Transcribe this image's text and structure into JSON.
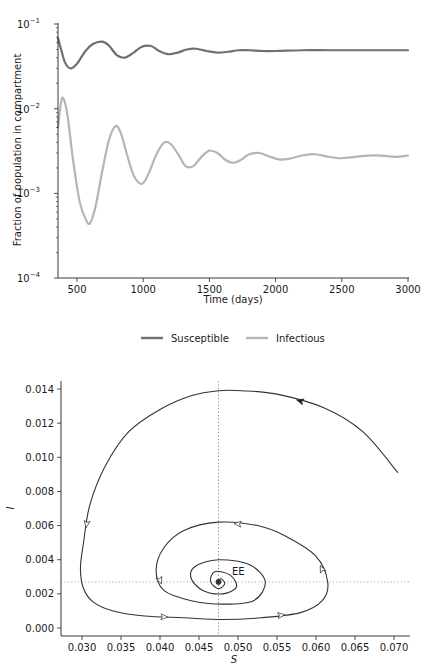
{
  "chart_data": [
    {
      "type": "line",
      "title": "",
      "xlabel": "Time (days)",
      "ylabel": "Fraction of population in compartment",
      "yscale": "log",
      "xlim": [
        357,
        3000
      ],
      "ylim": [
        0.0001,
        0.1
      ],
      "xticks": [
        "500",
        "1000",
        "1500",
        "2000",
        "2500",
        "3000"
      ],
      "yticks": [
        "10^-1",
        "10^-2",
        "10^-3",
        "10^-4"
      ],
      "grid": false,
      "legend_position": "below",
      "series": [
        {
          "name": "Susceptible",
          "color": "#707070",
          "x": [
            357,
            380,
            410,
            450,
            500,
            560,
            620,
            690,
            740,
            800,
            860,
            920,
            990,
            1060,
            1120,
            1190,
            1260,
            1330,
            1400,
            1480,
            1560,
            1640,
            1720,
            1800,
            1900,
            2000,
            2200,
            2400,
            2600,
            2800,
            3000
          ],
          "values": [
            0.068,
            0.05,
            0.035,
            0.03,
            0.034,
            0.047,
            0.058,
            0.062,
            0.056,
            0.043,
            0.04,
            0.045,
            0.054,
            0.055,
            0.048,
            0.044,
            0.046,
            0.05,
            0.051,
            0.048,
            0.046,
            0.047,
            0.049,
            0.049,
            0.048,
            0.048,
            0.049,
            0.049,
            0.049,
            0.049,
            0.049
          ]
        },
        {
          "name": "Infectious",
          "color": "#b5b5b5",
          "x": [
            357,
            380,
            400,
            430,
            470,
            520,
            570,
            600,
            640,
            690,
            740,
            790,
            830,
            880,
            930,
            990,
            1040,
            1100,
            1160,
            1210,
            1270,
            1320,
            1380,
            1440,
            1500,
            1560,
            1620,
            1680,
            1740,
            1800,
            1880,
            1960,
            2040,
            2120,
            2200,
            2300,
            2400,
            2500,
            2600,
            2700,
            2800,
            2900,
            3000
          ],
          "values": [
            0.006,
            0.012,
            0.013,
            0.008,
            0.0025,
            0.0008,
            0.00048,
            0.00045,
            0.0007,
            0.0018,
            0.0042,
            0.0062,
            0.0052,
            0.0028,
            0.0016,
            0.0013,
            0.0017,
            0.0029,
            0.004,
            0.0038,
            0.0028,
            0.0021,
            0.0021,
            0.0027,
            0.0032,
            0.003,
            0.0025,
            0.0023,
            0.0025,
            0.0029,
            0.003,
            0.0027,
            0.0025,
            0.0026,
            0.0028,
            0.0029,
            0.0027,
            0.0026,
            0.0027,
            0.0028,
            0.0028,
            0.0027,
            0.0028
          ]
        }
      ]
    },
    {
      "type": "line",
      "subtype": "phase-portrait",
      "title": "",
      "xlabel": "S",
      "ylabel": "I",
      "xlim": [
        0.0273,
        0.0718
      ],
      "ylim": [
        -0.0004,
        0.0145
      ],
      "xticks": [
        "0.030",
        "0.035",
        "0.040",
        "0.045",
        "0.050",
        "0.055",
        "0.060",
        "0.065",
        "0.070"
      ],
      "yticks": [
        "0.000",
        "0.002",
        "0.004",
        "0.006",
        "0.008",
        "0.010",
        "0.012",
        "0.014"
      ],
      "grid": false,
      "annotations": [
        {
          "text": "EE",
          "S": 0.0488,
          "I": 0.0031
        }
      ],
      "reference_lines": {
        "vertical_S": 0.0475,
        "horizontal_I": 0.0027,
        "style": "dotted"
      },
      "series": [
        {
          "name": "trajectory",
          "color": "#333333",
          "S": [
            0.0705,
            0.066,
            0.061,
            0.055,
            0.0505,
            0.0475,
            0.044,
            0.04,
            0.036,
            0.033,
            0.031,
            0.0302,
            0.0298,
            0.0302,
            0.0315,
            0.034,
            0.038,
            0.043,
            0.048,
            0.053,
            0.058,
            0.0608,
            0.0615,
            0.06,
            0.056,
            0.0525,
            0.0475,
            0.043,
            0.0405,
            0.0395,
            0.0405,
            0.044,
            0.048,
            0.052,
            0.0535,
            0.0515,
            0.0475,
            0.0445,
            0.044,
            0.0455,
            0.048,
            0.0498,
            0.049,
            0.047,
            0.0465,
            0.0475,
            0.0483,
            0.0478,
            0.0475
          ],
          "I": [
            0.0091,
            0.0115,
            0.0129,
            0.0137,
            0.0139,
            0.0139,
            0.0136,
            0.0128,
            0.0115,
            0.0095,
            0.0072,
            0.005,
            0.0035,
            0.0023,
            0.0015,
            0.001,
            0.0007,
            0.0006,
            0.0005,
            0.0006,
            0.0009,
            0.0016,
            0.0027,
            0.0042,
            0.0054,
            0.006,
            0.0062,
            0.0057,
            0.0047,
            0.0034,
            0.0022,
            0.0016,
            0.0014,
            0.0016,
            0.0027,
            0.0037,
            0.004,
            0.0036,
            0.0029,
            0.0022,
            0.002,
            0.0024,
            0.0031,
            0.0033,
            0.0027,
            0.0023,
            0.0026,
            0.0029,
            0.0027
          ]
        }
      ]
    }
  ],
  "top_chart": {
    "xlabel": "Time (days)",
    "ylabel": "Fraction of population in compartment",
    "xticks": [
      "500",
      "1000",
      "1500",
      "2000",
      "2500",
      "3000"
    ],
    "ytick_base": "10",
    "yticks_exp": [
      "−1",
      "−2",
      "−3",
      "−4"
    ]
  },
  "legend": {
    "items": [
      {
        "label": "Susceptible",
        "color": "#707070"
      },
      {
        "label": "Infectious",
        "color": "#b5b5b5"
      }
    ]
  },
  "bottom_chart": {
    "xlabel": "S",
    "ylabel": "I",
    "annotation": "EE",
    "xticks": [
      "0.030",
      "0.035",
      "0.040",
      "0.045",
      "0.050",
      "0.055",
      "0.060",
      "0.065",
      "0.070"
    ],
    "yticks": [
      "0.000",
      "0.002",
      "0.004",
      "0.006",
      "0.008",
      "0.010",
      "0.012",
      "0.014"
    ]
  }
}
